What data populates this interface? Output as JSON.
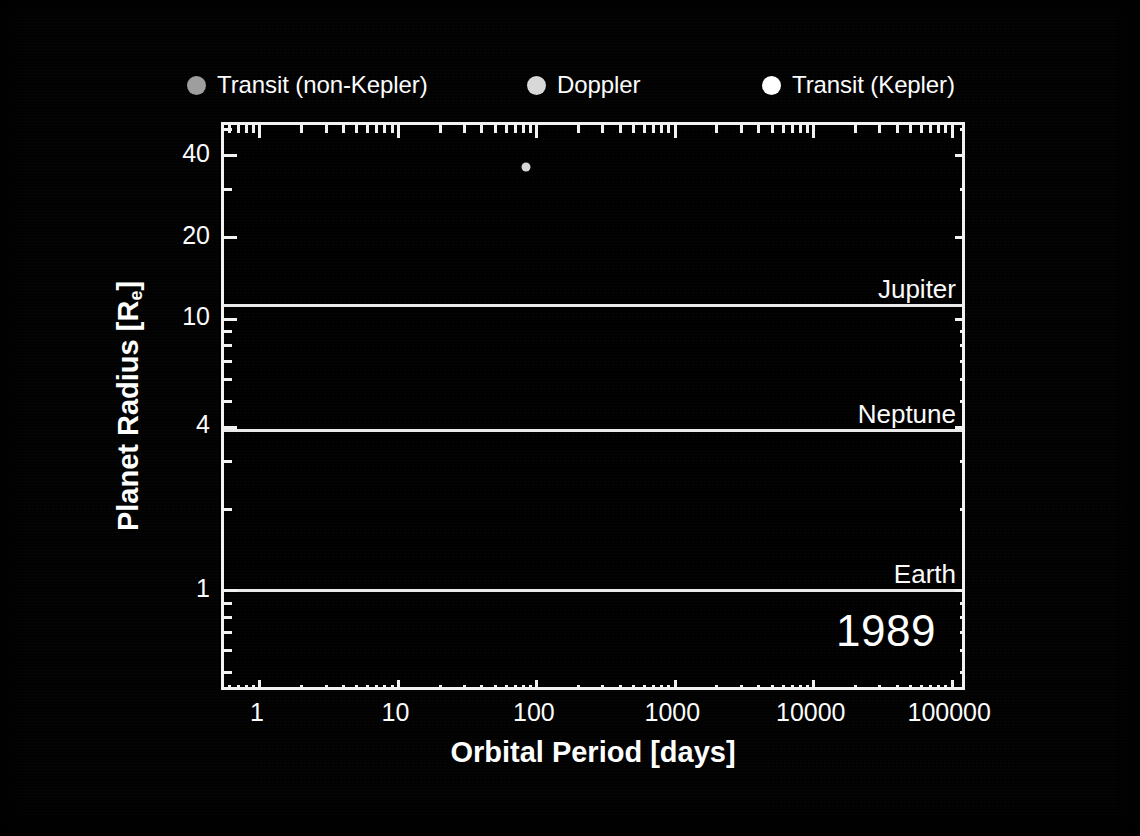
{
  "figure": {
    "background_color": "#000000",
    "foreground_color": "#f2f2f2",
    "year_annotation": "1989"
  },
  "legend": {
    "position": "above-plot",
    "entries": [
      {
        "label": "Transit (non-Kepler)",
        "marker": "filled-circle",
        "color": "#9e9e9e",
        "icon": "circle-marker-icon"
      },
      {
        "label": "Doppler",
        "marker": "filled-circle",
        "color": "#d8d8d8",
        "icon": "circle-marker-icon"
      },
      {
        "label": "Transit (Kepler)",
        "marker": "filled-circle",
        "color": "#ffffff",
        "icon": "circle-marker-icon"
      }
    ]
  },
  "chart_data": {
    "type": "scatter",
    "title": "",
    "subtitle": "",
    "annotation": "1989",
    "xlabel": "Orbital Period [days]",
    "ylabel": "Planet Radius [R⊕]",
    "ylabel_text": "Planet Radius [R",
    "ylabel_sub": "e",
    "ylabel_tail": "]",
    "xscale": "log",
    "yscale": "log",
    "xlim": [
      0.55,
      130000
    ],
    "ylim": [
      0.42,
      52
    ],
    "grid": false,
    "legend_position": "above-plot",
    "x_ticks": [
      {
        "value": 1,
        "label": "1"
      },
      {
        "value": 10,
        "label": "10"
      },
      {
        "value": 100,
        "label": "100"
      },
      {
        "value": 1000,
        "label": "1000"
      },
      {
        "value": 10000,
        "label": "10000"
      },
      {
        "value": 100000,
        "label": "100000"
      }
    ],
    "y_ticks": [
      {
        "value": 40,
        "label": "40"
      },
      {
        "value": 20,
        "label": "20"
      },
      {
        "value": 10,
        "label": "10"
      },
      {
        "value": 4,
        "label": "4"
      },
      {
        "value": 1,
        "label": "1"
      }
    ],
    "reference_lines": [
      {
        "label": "Jupiter",
        "radius": 11.2,
        "color": "#eaeaea"
      },
      {
        "label": "Neptune",
        "radius": 3.88,
        "color": "#eaeaea"
      },
      {
        "label": "Earth",
        "radius": 1.0,
        "color": "#eaeaea"
      }
    ],
    "series": [
      {
        "name": "Transit (non-Kepler)",
        "color": "#9e9e9e",
        "points": []
      },
      {
        "name": "Doppler",
        "color": "#d8d8d8",
        "points": [
          {
            "period": 84,
            "radius": 36.5,
            "size": 9
          }
        ]
      },
      {
        "name": "Transit (Kepler)",
        "color": "#ffffff",
        "points": []
      }
    ]
  }
}
